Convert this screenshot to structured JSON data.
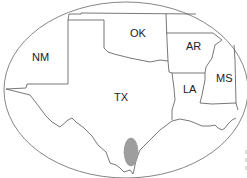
{
  "map": {
    "region": "South-Central United States",
    "frame_shape": "ellipse",
    "states": [
      {
        "abbr": "NM",
        "label": "NM"
      },
      {
        "abbr": "OK",
        "label": "OK"
      },
      {
        "abbr": "AR",
        "label": "AR"
      },
      {
        "abbr": "TX",
        "label": "TX"
      },
      {
        "abbr": "LA",
        "label": "LA"
      },
      {
        "abbr": "MS",
        "label": "MS"
      }
    ],
    "highlight": {
      "shape": "ellipse",
      "location": "South Texas",
      "color": "#9e9e9e"
    },
    "colors": {
      "background": "#ffffff",
      "borders": "#555555",
      "highlight": "#9e9e9e"
    }
  }
}
